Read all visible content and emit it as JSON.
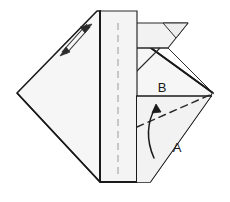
{
  "diagram": {
    "kind": "origami-fold-step",
    "background_color": "#ffffff",
    "paper_fill": "#f7f7f7",
    "paper_fill_shaded": "#efefef",
    "outline_color": "#1a1a1a",
    "crease_color": "#8a8a8a",
    "dashed_fold_color": "#2b2b2b",
    "arrow_color": "#1a1a1a"
  },
  "labels": {
    "fold_a": "A",
    "fold_b": "B"
  },
  "annotations": {
    "dashed_fold_line": "valley-fold-line-a",
    "curved_arrow": "fold-direction-arrow",
    "straight_arrow_b": "fold-direction-arrow-b",
    "corner_arrow": "upper-left-fold-arrow"
  }
}
